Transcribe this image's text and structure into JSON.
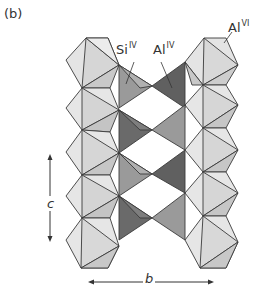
{
  "figure": {
    "panel_label": "(b)",
    "labels": {
      "si_tetrahedral": {
        "base": "Si",
        "superscript": "IV"
      },
      "al_tetrahedral": {
        "base": "Al",
        "superscript": "IV"
      },
      "al_octahedral": {
        "base": "Al",
        "superscript": "VI"
      }
    },
    "axes": {
      "vertical": "c",
      "horizontal": "b"
    },
    "colors": {
      "octahedra_light": "#e6e6e6",
      "octahedra_mid": "#d2d2d2",
      "octahedra_dark": "#bdbdbd",
      "si_tetra_face": "#8e8e8e",
      "si_tetra_side": "#a8a8a8",
      "al_tetra_dark": "#5e5e5e",
      "al_tetra_mid": "#8a8a8a",
      "edge": "#3a3a3a",
      "label": "#333333"
    }
  }
}
